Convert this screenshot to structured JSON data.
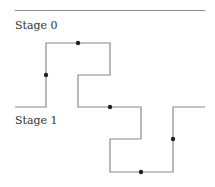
{
  "diagram": {
    "labels": {
      "stage0": "Stage 0",
      "stage1": "Stage 1"
    },
    "colors": {
      "line": "#8a8a8a",
      "dot": "#222222",
      "text": "#333333"
    },
    "top_rule": {
      "x1": 15,
      "y1": 10.5,
      "x2": 205,
      "y2": 10.5
    },
    "path_points": [
      [
        15,
        107
      ],
      [
        46,
        107
      ],
      [
        46,
        43
      ],
      [
        110,
        43
      ],
      [
        110,
        75
      ],
      [
        78,
        75
      ],
      [
        78,
        107
      ],
      [
        141,
        107
      ],
      [
        141,
        139
      ],
      [
        110,
        139
      ],
      [
        110,
        172
      ],
      [
        173,
        172
      ],
      [
        173,
        107
      ],
      [
        205,
        107
      ]
    ],
    "dots": [
      [
        46,
        75
      ],
      [
        78,
        43
      ],
      [
        110,
        107
      ],
      [
        141,
        172
      ],
      [
        173,
        139
      ]
    ]
  }
}
